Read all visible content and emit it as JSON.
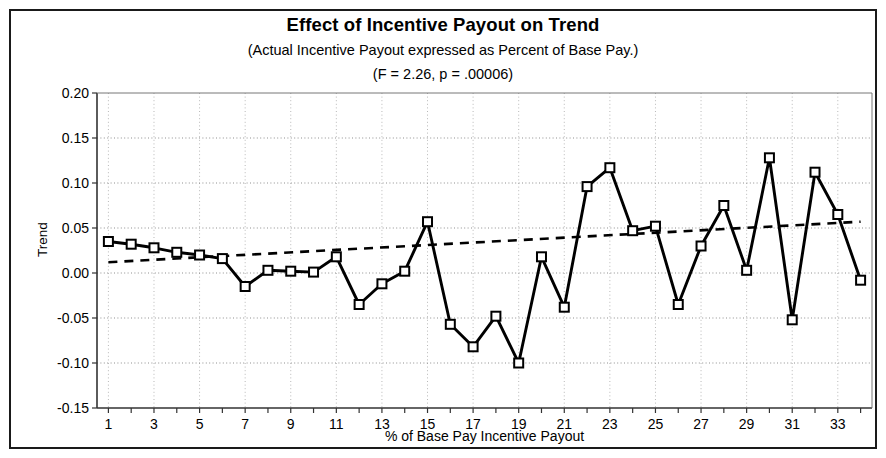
{
  "figure": {
    "width": 886,
    "height": 458,
    "border_color": "#1a1a1a",
    "background": "#ffffff"
  },
  "chart_data": {
    "type": "line",
    "title": "Effect of Incentive Payout on Trend",
    "subtitle": "(Actual Incentive Payout expressed as Percent of Base Pay.)",
    "subtitle2": "(F = 2.26, p = .00006)",
    "xlabel": "% of Base Pay Incentive Payout",
    "ylabel": "Trend",
    "grid": true,
    "legend": "none",
    "xlim": [
      0.5,
      34.5
    ],
    "ylim": [
      -0.15,
      0.2
    ],
    "ytick_labels": [
      "0.20",
      "0.15",
      "0.10",
      "0.05",
      "0.00",
      "-0.05",
      "-0.10",
      "-0.15"
    ],
    "yticks": [
      0.2,
      0.15,
      0.1,
      0.05,
      0.0,
      -0.05,
      -0.1,
      -0.15
    ],
    "xtick_labels": [
      "1",
      "3",
      "5",
      "7",
      "9",
      "11",
      "13",
      "15",
      "17",
      "19",
      "21",
      "23",
      "25",
      "27",
      "29",
      "31",
      "33"
    ],
    "xticks_labeled": [
      1,
      3,
      5,
      7,
      9,
      11,
      13,
      15,
      17,
      19,
      21,
      23,
      25,
      27,
      29,
      31,
      33
    ],
    "xticks_all": [
      1,
      2,
      3,
      4,
      5,
      6,
      7,
      8,
      9,
      10,
      11,
      12,
      13,
      14,
      15,
      16,
      17,
      18,
      19,
      20,
      21,
      22,
      23,
      24,
      25,
      26,
      27,
      28,
      29,
      30,
      31,
      32,
      33,
      34
    ],
    "x": [
      1,
      2,
      3,
      4,
      5,
      6,
      7,
      8,
      9,
      10,
      11,
      12,
      13,
      14,
      15,
      16,
      17,
      18,
      19,
      20,
      21,
      22,
      23,
      24,
      25,
      26,
      27,
      28,
      29,
      30,
      31,
      32,
      33,
      34
    ],
    "series": [
      {
        "name": "Trend",
        "style": "solid-with-square-markers",
        "color": "#000000",
        "values": [
          0.035,
          0.032,
          0.028,
          0.023,
          0.02,
          0.016,
          -0.015,
          0.003,
          0.002,
          0.001,
          0.018,
          -0.035,
          -0.012,
          0.002,
          0.057,
          -0.057,
          -0.082,
          -0.048,
          -0.1,
          0.018,
          -0.038,
          0.096,
          0.117,
          0.047,
          0.052,
          -0.035,
          0.03,
          0.075,
          0.003,
          0.128,
          -0.052,
          0.112,
          0.065,
          -0.008
        ]
      },
      {
        "name": "Linear trend line",
        "style": "dashed",
        "color": "#000000",
        "endpoints": [
          {
            "x": 1,
            "y": 0.012
          },
          {
            "x": 34,
            "y": 0.057
          }
        ]
      }
    ]
  }
}
